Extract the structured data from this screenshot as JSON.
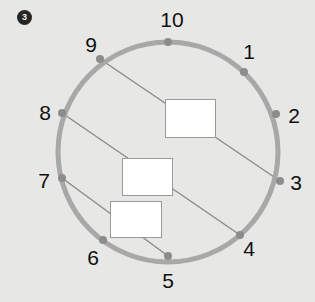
{
  "canvas": {
    "width": 315,
    "height": 302,
    "background": "#e7e7e6"
  },
  "badge": {
    "label": "3",
    "background": "#262626",
    "text_color": "#f2f2f2"
  },
  "diagram": {
    "type": "circle-with-chords",
    "circle": {
      "center_x": 168,
      "center_y": 152,
      "radius": 110,
      "stroke": "#a8a8a8",
      "stroke_width": 5
    },
    "point_color": "#8c8c8c",
    "point_radius": 4,
    "chord_color": "#8a8a8a",
    "chord_width": 1.4,
    "points": [
      {
        "label": "1",
        "x": 244,
        "y": 72,
        "label_x": 249,
        "label_y": 51
      },
      {
        "label": "2",
        "x": 276,
        "y": 114,
        "label_x": 294,
        "label_y": 115
      },
      {
        "label": "3",
        "x": 280,
        "y": 181,
        "label_x": 296,
        "label_y": 182
      },
      {
        "label": "4",
        "x": 240,
        "y": 235,
        "label_x": 249,
        "label_y": 248
      },
      {
        "label": "5",
        "x": 168,
        "y": 256,
        "label_x": 168,
        "label_y": 280
      },
      {
        "label": "6",
        "x": 103,
        "y": 240,
        "label_x": 93,
        "label_y": 257
      },
      {
        "label": "7",
        "x": 62,
        "y": 178,
        "label_x": 44,
        "label_y": 180
      },
      {
        "label": "8",
        "x": 62,
        "y": 113,
        "label_x": 45,
        "label_y": 112
      },
      {
        "label": "9",
        "x": 100,
        "y": 59,
        "label_x": 91,
        "label_y": 44
      },
      {
        "label": "10",
        "x": 168,
        "y": 42,
        "label_x": 172,
        "label_y": 19
      }
    ],
    "chords": [
      {
        "name": "chord-9-3",
        "from": "9",
        "to": "3",
        "x1": 100,
        "y1": 59,
        "x2": 280,
        "y2": 181
      },
      {
        "name": "chord-8-4",
        "from": "8",
        "to": "4",
        "x1": 62,
        "y1": 113,
        "x2": 240,
        "y2": 235
      },
      {
        "name": "chord-7-5",
        "from": "7",
        "to": "5",
        "x1": 62,
        "y1": 178,
        "x2": 168,
        "y2": 256
      }
    ],
    "boxes": [
      {
        "name": "box-top",
        "x": 165,
        "y": 99,
        "width": 51,
        "height": 39,
        "fill": "#ffffff",
        "border": "#9a9a9a",
        "text": ""
      },
      {
        "name": "box-middle",
        "x": 122,
        "y": 158,
        "width": 51,
        "height": 38,
        "fill": "#ffffff",
        "border": "#9a9a9a",
        "text": ""
      },
      {
        "name": "box-bottom",
        "x": 110,
        "y": 201,
        "width": 52,
        "height": 37,
        "fill": "#ffffff",
        "border": "#9a9a9a",
        "text": ""
      }
    ]
  }
}
